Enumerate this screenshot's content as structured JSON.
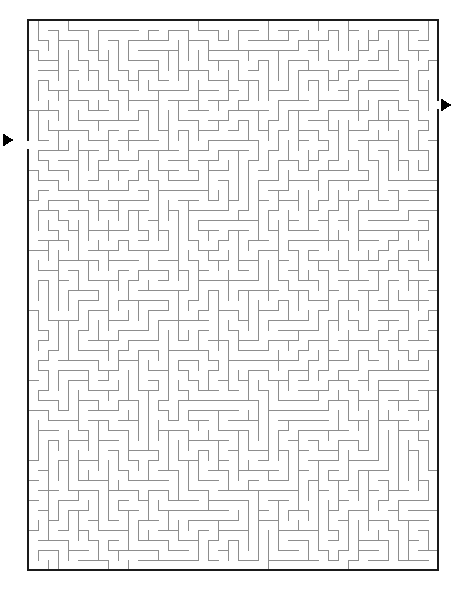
{
  "page": {
    "background_color": "#ffffff",
    "width": 472,
    "height": 591
  },
  "maze": {
    "type": "rectangular-perfect-maze",
    "columns": 41,
    "rows": 55,
    "cell_size": 10,
    "origin_x": 28,
    "origin_y": 20,
    "width": 412,
    "height": 550,
    "border_color": "#1a1a1a",
    "wall_color": "#8d8d8d",
    "passage_color": "#ffffff",
    "border_thickness": 1.6,
    "wall_thickness": 1,
    "seed": 20240517
  },
  "entrance": {
    "label": "entrance",
    "side": "left",
    "row": 12,
    "gap_y": 140,
    "marker": "triangle-right",
    "marker_x": 8,
    "marker_y": 140,
    "marker_size": 11,
    "marker_color": "#000000"
  },
  "exit": {
    "label": "exit",
    "side": "right",
    "row": 8,
    "gap_y": 105,
    "marker": "triangle-right",
    "marker_x": 446,
    "marker_y": 105,
    "marker_size": 11,
    "marker_color": "#000000"
  }
}
